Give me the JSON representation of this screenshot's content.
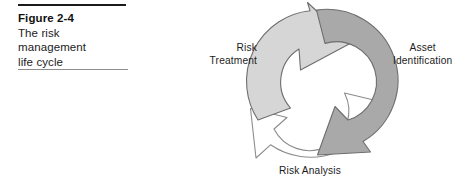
{
  "figure": {
    "number": "Figure 2-4",
    "caption_lines": [
      "The risk",
      "management",
      "life cycle"
    ],
    "caption_text": "The risk management life cycle"
  },
  "diagram": {
    "type": "cycle",
    "title": "The risk management life cycle",
    "direction": "clockwise",
    "stages": [
      {
        "id": "risk-treatment",
        "label_lines": [
          "Risk",
          "Treatment"
        ],
        "label": "Risk Treatment",
        "position": "left",
        "arrow_fill": "#d6d6d6",
        "arrow_stroke": "#6e6e6e"
      },
      {
        "id": "asset-identification",
        "label_lines": [
          "Asset",
          "Identification"
        ],
        "label": "Asset Identification",
        "position": "right",
        "arrow_fill": "#a9a9a9",
        "arrow_stroke": "#6e6e6e"
      },
      {
        "id": "risk-analysis",
        "label_lines": [
          "Risk Analysis"
        ],
        "label": "Risk Analysis",
        "position": "bottom",
        "arrow_fill": "#ffffff",
        "arrow_stroke": "#8c8c8c"
      }
    ]
  },
  "colors": {
    "rule_top": "#1b1b1b",
    "rule_bottom": "#8e8e8e",
    "text": "#1c1c1c",
    "arrow_light": "#d6d6d6",
    "arrow_dark": "#a9a9a9",
    "arrow_white": "#ffffff",
    "arrow_outline": "#6e6e6e",
    "background": "#ffffff"
  }
}
